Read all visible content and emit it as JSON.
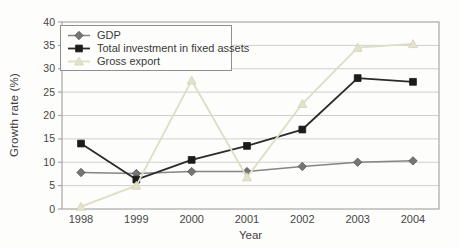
{
  "figure": {
    "ylabel": "Growth rate (%)",
    "xlabel": "Year",
    "background": "#fdfdfb",
    "frame_color": "#a8a8a8",
    "gridline_color": "#cfcfcf",
    "tick_text_color": "#454545"
  },
  "chart_data": {
    "type": "line",
    "title": "",
    "xlabel": "Year",
    "ylabel": "Growth rate (%)",
    "ylim": [
      0,
      40
    ],
    "ytick_step": 5,
    "grid": true,
    "legend_position": "top-left",
    "categories": [
      "1998",
      "1999",
      "2000",
      "2001",
      "2002",
      "2003",
      "2004"
    ],
    "series": [
      {
        "name": "GDP",
        "marker": "diamond",
        "line_color": "#858585",
        "marker_fill": "#757575",
        "marker_stroke": "#565656",
        "values": [
          7.8,
          7.6,
          8.0,
          8.0,
          9.1,
          10.0,
          10.3
        ]
      },
      {
        "name": "Total investment in fixed assets",
        "marker": "square",
        "line_color": "#2b2b2b",
        "marker_fill": "#1c1c1c",
        "marker_stroke": "#1c1c1c",
        "values": [
          14.0,
          6.3,
          10.5,
          13.5,
          17.0,
          28.0,
          27.2
        ]
      },
      {
        "name": "Gross export",
        "marker": "triangle",
        "line_color": "#deddc5",
        "marker_fill": "#e3e2cd",
        "marker_stroke": "#d3d2b6",
        "values": [
          0.5,
          5.0,
          27.5,
          6.8,
          22.5,
          34.5,
          35.3
        ]
      }
    ]
  }
}
